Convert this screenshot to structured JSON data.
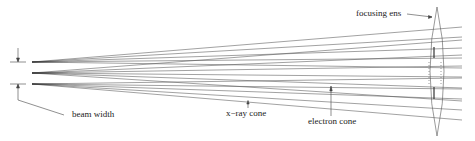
{
  "diagram": {
    "labels": {
      "focusing_lens": "focusing  ens",
      "beam_width": "beam width",
      "xray_cone": "x−ray cone",
      "electron_cone": "electron cone"
    },
    "colors": {
      "line": "#555555",
      "text": "#222222",
      "background": "#ffffff"
    },
    "sources": [
      {
        "name": "top-source",
        "x": 32,
        "y": 62
      },
      {
        "name": "middle-source",
        "x": 32,
        "y": 73
      },
      {
        "name": "bottom-source",
        "x": 32,
        "y": 84
      }
    ],
    "lens": {
      "x": 437,
      "top": 7,
      "bottom": 136,
      "half_width": 7
    }
  }
}
